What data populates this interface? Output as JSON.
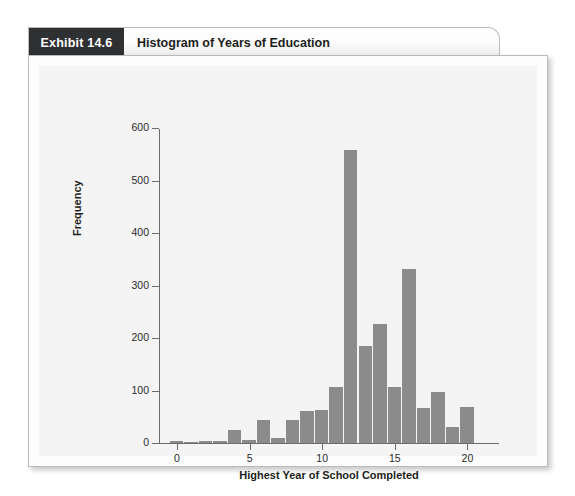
{
  "exhibit": {
    "tag": "Exhibit 14.6",
    "title": "Histogram of Years of Education"
  },
  "colors": {
    "tag_background": "#2f3032",
    "tag_text": "#ffffff",
    "bar_fill": "#8b8b8b",
    "axis": "#6b6b6b",
    "panel_background": "#f4f4f4",
    "card_background": "#fdfdfd",
    "card_border": "#b9bbbd"
  },
  "chart_data": {
    "type": "bar",
    "title": "Histogram of Years of Education",
    "xlabel": "Highest Year of School Completed",
    "ylabel": "Frequency",
    "xlim": [
      -0.5,
      20.5
    ],
    "ylim": [
      0,
      600
    ],
    "xticks": [
      0,
      5,
      10,
      15,
      20
    ],
    "yticks": [
      0,
      100,
      200,
      300,
      400,
      500,
      600
    ],
    "grid": false,
    "legend": null,
    "bin_width": 1,
    "categories": [
      0,
      1,
      2,
      3,
      4,
      5,
      6,
      7,
      8,
      9,
      10,
      11,
      12,
      13,
      14,
      15,
      16,
      17,
      18,
      19,
      20
    ],
    "values": [
      4,
      2,
      4,
      3,
      25,
      6,
      44,
      9,
      43,
      61,
      62,
      107,
      558,
      185,
      226,
      107,
      331,
      67,
      98,
      30,
      68
    ]
  }
}
